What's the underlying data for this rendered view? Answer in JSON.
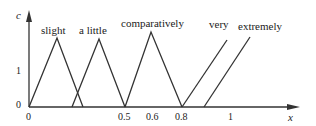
{
  "diagram": {
    "type": "fuzzy-membership-functions",
    "y_axis": {
      "label": "c",
      "ticks": [
        "0",
        "1"
      ]
    },
    "x_axis": {
      "label": "x",
      "ticks": [
        "0",
        "0.5",
        "0.6",
        "0.8",
        "1"
      ]
    },
    "sets": [
      {
        "name": "slight",
        "shape": "triangle"
      },
      {
        "name": "a little",
        "shape": "triangle"
      },
      {
        "name": "comparatively",
        "shape": "triangle"
      },
      {
        "name": "very",
        "shape": "ramp"
      },
      {
        "name": "extremely",
        "shape": "ramp"
      }
    ],
    "line_color": "#333333"
  }
}
